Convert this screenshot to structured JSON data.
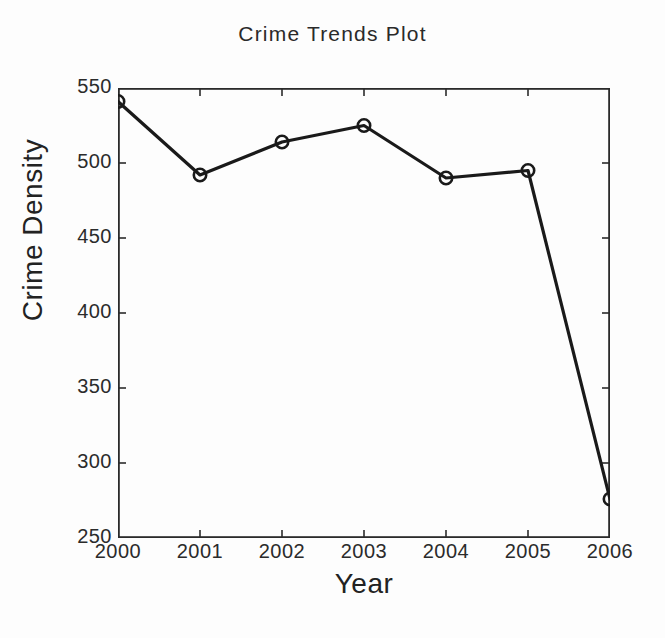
{
  "chart_data": {
    "type": "line",
    "title": "Crime Trends Plot",
    "xlabel": "Year",
    "ylabel": "Crime Density",
    "categories": [
      "2000",
      "2001",
      "2002",
      "2003",
      "2004",
      "2005",
      "2006"
    ],
    "x": [
      2000,
      2001,
      2002,
      2003,
      2004,
      2005,
      2006
    ],
    "values": [
      541,
      492,
      514,
      525,
      490,
      495,
      276
    ],
    "series": [
      {
        "name": "Crime Density",
        "values": [
          541,
          492,
          514,
          525,
          490,
          495,
          276
        ]
      }
    ],
    "xlim": [
      2000,
      2006
    ],
    "ylim": [
      250,
      550
    ],
    "ytick_labels": [
      "550",
      "500",
      "450",
      "400",
      "350",
      "300",
      "250"
    ],
    "ytick_values": [
      550,
      500,
      450,
      400,
      350,
      300,
      250
    ],
    "xtick_labels": [
      "2000",
      "2001",
      "2002",
      "2003",
      "2004",
      "2005",
      "2006"
    ],
    "grid": false,
    "legend": false,
    "marker": "circle",
    "line_color": "#1a1a1a",
    "marker_color": "#1a1a1a",
    "background_color": "#fdfdfd",
    "axis_color": "#2b2b2b"
  }
}
